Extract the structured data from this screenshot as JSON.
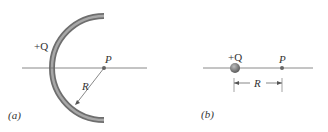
{
  "figure_a": {
    "charge_label": "+Q",
    "point_label": "P",
    "radius_label": "R",
    "caption": "(a)"
  },
  "figure_b": {
    "charge_label": "+Q",
    "point_label": "P",
    "distance_label": "R",
    "caption": "(b)"
  },
  "colors": {
    "arc": "#7a7a7a",
    "line": "#6a6a6a",
    "text": "#333333"
  }
}
